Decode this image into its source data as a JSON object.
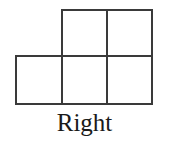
{
  "figure": {
    "caption": "Right",
    "shape_name": "p-pentomino",
    "background_color": "#ffffff",
    "stroke_color": "#3a3a3a",
    "stroke_width": 2,
    "cell_size": 46,
    "grid": {
      "vertical_lines_x": [
        16,
        62,
        107,
        152
      ],
      "horizontal_lines_y": [
        10,
        56,
        104
      ],
      "rows": 2,
      "columns": 3,
      "total_cells": 5
    },
    "cells": [
      {
        "id": "cell-top-middle",
        "row": 0,
        "col": 1,
        "x": 62,
        "y": 10,
        "w": 45,
        "h": 46
      },
      {
        "id": "cell-top-right",
        "row": 0,
        "col": 2,
        "x": 107,
        "y": 10,
        "w": 45,
        "h": 46
      },
      {
        "id": "cell-bottom-left",
        "row": 1,
        "col": 0,
        "x": 16,
        "y": 56,
        "w": 46,
        "h": 48
      },
      {
        "id": "cell-bottom-middle",
        "row": 1,
        "col": 1,
        "x": 62,
        "y": 56,
        "w": 45,
        "h": 48
      },
      {
        "id": "cell-bottom-right",
        "row": 1,
        "col": 2,
        "x": 107,
        "y": 56,
        "w": 45,
        "h": 48
      }
    ],
    "outline_path": "M 62 10 L 152 10 L 152 104 L 16 104 L 16 56 L 62 56 Z",
    "inner_lines": [
      {
        "id": "divider-vertical-mid",
        "x1": 62,
        "y1": 10,
        "x2": 62,
        "y2": 104
      },
      {
        "id": "divider-vertical-right",
        "x1": 107,
        "y1": 10,
        "x2": 107,
        "y2": 104
      },
      {
        "id": "divider-horizontal",
        "x1": 62,
        "y1": 56,
        "x2": 152,
        "y2": 56
      }
    ]
  }
}
